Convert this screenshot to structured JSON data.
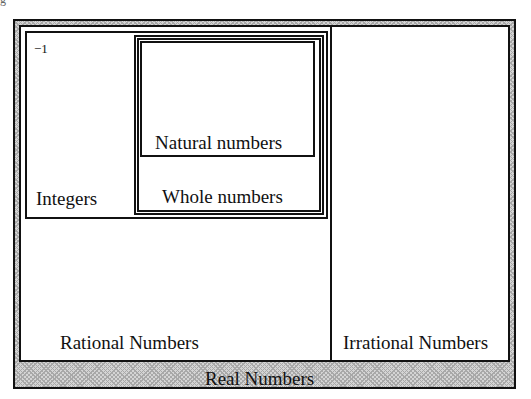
{
  "diagram": {
    "title": "Real Numbers",
    "sets": {
      "real": {
        "label": "Real Numbers"
      },
      "rational": {
        "label": "Rational Numbers"
      },
      "irrational": {
        "label": "Irrational Numbers"
      },
      "integers": {
        "label": "Integers",
        "example": "−1"
      },
      "whole": {
        "label": "Whole numbers"
      },
      "natural": {
        "label": "Natural numbers"
      }
    },
    "corner_mark": "g"
  }
}
